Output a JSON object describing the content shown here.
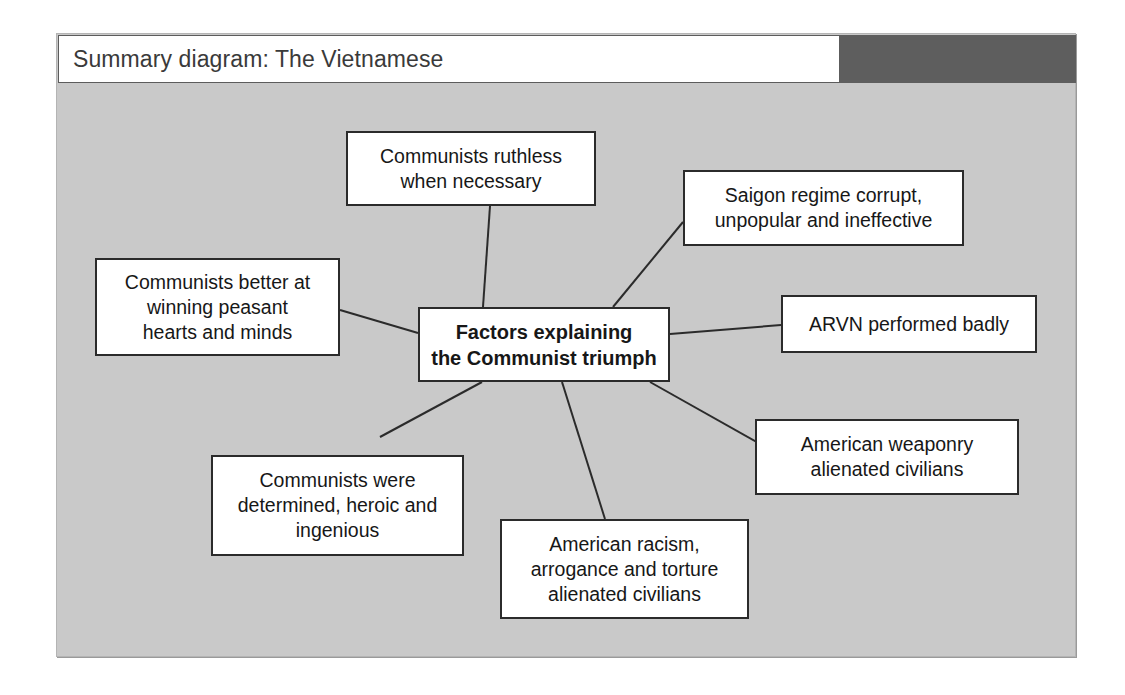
{
  "header": {
    "title": "Summary diagram: The Vietnamese",
    "accent_block_color": "#5e5e5e",
    "bar_background": "#ffffff"
  },
  "panel": {
    "background_color": "#c9c9c9",
    "border_color": "#b4b4b4"
  },
  "diagram": {
    "type": "mind-map",
    "center": {
      "id": "center",
      "text": "Factors explaining\nthe Communist triumph",
      "line1": "Factors explaining",
      "line2": "the Communist triumph",
      "bold": true,
      "box": {
        "x": 418,
        "y": 307,
        "w": 252,
        "h": 75
      }
    },
    "nodes": [
      {
        "id": "communists-ruthless",
        "line1": "Communists ruthless",
        "line2": "when necessary",
        "line3": "",
        "box": {
          "x": 346,
          "y": 131,
          "w": 250,
          "h": 75
        }
      },
      {
        "id": "saigon-regime-corrupt",
        "line1": "Saigon regime corrupt,",
        "line2": "unpopular and ineffective",
        "line3": "",
        "box": {
          "x": 683,
          "y": 170,
          "w": 281,
          "h": 76
        }
      },
      {
        "id": "arvn-performed-badly",
        "line1": "ARVN performed badly",
        "line2": "",
        "line3": "",
        "box": {
          "x": 781,
          "y": 295,
          "w": 256,
          "h": 58
        }
      },
      {
        "id": "american-weaponry",
        "line1": "American weaponry",
        "line2": "alienated civilians",
        "line3": "",
        "box": {
          "x": 755,
          "y": 419,
          "w": 264,
          "h": 76
        }
      },
      {
        "id": "american-racism",
        "line1": "American racism,",
        "line2": "arrogance and torture",
        "line3": "alienated civilians",
        "box": {
          "x": 500,
          "y": 519,
          "w": 249,
          "h": 100
        }
      },
      {
        "id": "communists-determined",
        "line1": "Communists were",
        "line2": "determined, heroic and",
        "line3": "ingenious",
        "box": {
          "x": 211,
          "y": 455,
          "w": 253,
          "h": 101
        }
      },
      {
        "id": "communists-hearts-minds",
        "line1": "Communists better at",
        "line2": "winning peasant",
        "line3": "hearts and minds",
        "box": {
          "x": 95,
          "y": 258,
          "w": 245,
          "h": 98
        }
      }
    ],
    "connectors": [
      {
        "id": "link-center-ruthless",
        "x1": 483,
        "y1": 307,
        "x2": 490,
        "y2": 206
      },
      {
        "id": "link-center-saigon",
        "x1": 613,
        "y1": 307,
        "x2": 683,
        "y2": 222
      },
      {
        "id": "link-center-arvn",
        "x1": 670,
        "y1": 334,
        "x2": 781,
        "y2": 325
      },
      {
        "id": "link-center-weaponry",
        "x1": 650,
        "y1": 382,
        "x2": 769,
        "y2": 449
      },
      {
        "id": "link-center-racism",
        "x1": 562,
        "y1": 382,
        "x2": 605,
        "y2": 519
      },
      {
        "id": "link-center-determined",
        "x1": 482,
        "y1": 382,
        "x2": 380,
        "y2": 437
      },
      {
        "id": "link-center-hearts-minds",
        "x1": 418,
        "y1": 333,
        "x2": 340,
        "y2": 310
      }
    ],
    "line_color": "#2b2b2b",
    "node_fill": "#ffffff",
    "node_border": "#2b2b2b"
  }
}
